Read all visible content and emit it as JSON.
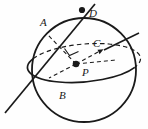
{
  "figure": {
    "type": "geometry-diagram",
    "background_color": "#fefefe",
    "ink_color": "#1a1a1a",
    "sphere": {
      "name": "sphere-outline",
      "center_x": 84,
      "center_y": 70,
      "radius": 52,
      "stroke_width": 1.7
    },
    "equator": {
      "name": "equator-ellipse",
      "center_x": 84,
      "center_y": 63,
      "rx": 51,
      "ry": 17,
      "rotation_deg": -5,
      "front_style": "solid",
      "back_style": "dashed"
    },
    "points": [
      {
        "id": "A",
        "label": "A",
        "x": 46,
        "y": 33,
        "label_x": 40,
        "label_y": 25,
        "dot": false
      },
      {
        "id": "D",
        "label": "D",
        "x": 82,
        "y": 10,
        "label_x": 89,
        "label_y": 15,
        "dot": true
      },
      {
        "id": "C",
        "label": "C",
        "x": 104,
        "y": 50,
        "label_x": 96,
        "label_y": 46,
        "dot": false
      },
      {
        "id": "P",
        "label": "P",
        "x": 76,
        "y": 64,
        "label_x": 83,
        "label_y": 74,
        "dot": true
      },
      {
        "id": "B",
        "label": "B",
        "x": 55,
        "y": 87,
        "label_x": 61,
        "label_y": 97,
        "dot": false
      }
    ],
    "segments": [
      {
        "name": "secant-line-DAB",
        "from": "D-extended",
        "to": "B-extended",
        "style": "solid"
      },
      {
        "name": "radius-PA",
        "from": "P",
        "to": "A",
        "style": "dashed"
      },
      {
        "name": "ray-PC",
        "from": "P",
        "to": "C",
        "style": "dashed",
        "arrow": true
      },
      {
        "name": "axis-line-upper-right",
        "style": "solid"
      },
      {
        "name": "right-angle-mark-at-P",
        "style": "solid"
      }
    ],
    "caption": ""
  }
}
